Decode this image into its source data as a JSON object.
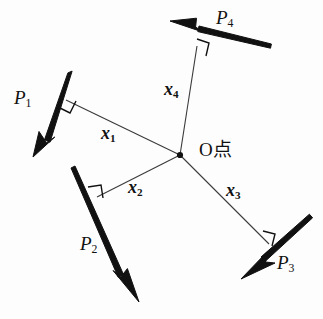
{
  "figure": {
    "background_color": "#fdfdfd",
    "line_color": "#111111",
    "thin_line_color": "#3a3a3a",
    "width": 323,
    "height": 319
  },
  "origin": {
    "label": "O点",
    "label_x": 199,
    "label_y": 140,
    "point_x": 180,
    "point_y": 155,
    "dot_radius": 3.1
  },
  "forces": [
    {
      "id": "P1",
      "label": "P",
      "subscript": "1",
      "label_x": 14,
      "label_y": 88,
      "tail_x": 70,
      "tail_y": 72,
      "tip_x": 33,
      "tip_y": 157,
      "shaft_width": 4.6,
      "head_length": 26,
      "head_width": 13,
      "direction": "down-left"
    },
    {
      "id": "P2",
      "label": "P",
      "subscript": "2",
      "label_x": 80,
      "label_y": 234,
      "tail_x": 73,
      "tail_y": 167,
      "tip_x": 139,
      "tip_y": 302,
      "shaft_width": 4.6,
      "head_length": 27,
      "head_width": 13,
      "direction": "down-right"
    },
    {
      "id": "P3",
      "label": "P",
      "subscript": "3",
      "label_x": 277,
      "label_y": 253,
      "tail_x": 311,
      "tail_y": 216,
      "tip_x": 241,
      "tip_y": 279,
      "shaft_width": 4.6,
      "head_length": 26,
      "head_width": 13,
      "direction": "down-left"
    },
    {
      "id": "P4",
      "label": "P",
      "subscript": "4",
      "label_x": 216,
      "label_y": 8,
      "tail_x": 270,
      "tail_y": 46,
      "tip_x": 170,
      "tip_y": 21,
      "shaft_width": 4.6,
      "head_length": 27,
      "head_width": 13,
      "direction": "up-left"
    }
  ],
  "arms": [
    {
      "id": "x1",
      "label": "x",
      "subscript": "1",
      "label_x": 101,
      "label_y": 124,
      "foot_x": 66,
      "foot_y": 100,
      "origin_x": 180,
      "origin_y": 155,
      "right_angle_size": 13
    },
    {
      "id": "x2",
      "label": "x",
      "subscript": "2",
      "label_x": 128,
      "label_y": 178,
      "foot_x": 97,
      "foot_y": 197,
      "origin_x": 180,
      "origin_y": 155,
      "right_angle_size": 13
    },
    {
      "id": "x3",
      "label": "x",
      "subscript": "3",
      "label_x": 226,
      "label_y": 181,
      "foot_x": 269,
      "foot_y": 244,
      "origin_x": 180,
      "origin_y": 155,
      "right_angle_size": 13
    },
    {
      "id": "x4",
      "label": "x",
      "subscript": "4",
      "label_x": 164,
      "label_y": 80,
      "foot_x": 197,
      "foot_y": 46,
      "origin_x": 180,
      "origin_y": 155,
      "right_angle_size": 13
    }
  ]
}
